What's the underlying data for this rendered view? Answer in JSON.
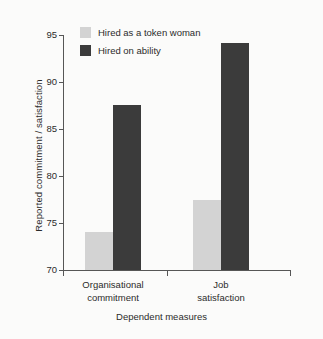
{
  "chart_data": {
    "type": "bar",
    "title": "",
    "xlabel": "Dependent measures",
    "ylabel": "Reported commitment / satisfaction",
    "categories": [
      "Organisational commitment",
      "Job satisfaction"
    ],
    "category_lines": [
      [
        "Organisational",
        "commitment"
      ],
      [
        "Job",
        "satisfaction"
      ]
    ],
    "series": [
      {
        "name": "Hired as a token woman",
        "color": "#d3d3d3",
        "values": [
          74.0,
          77.5
        ]
      },
      {
        "name": "Hired on ability",
        "color": "#3b3b3b",
        "values": [
          87.6,
          94.2
        ]
      }
    ],
    "ylim": [
      70,
      95
    ],
    "yticks": [
      70,
      75,
      80,
      85,
      90,
      95
    ],
    "ytick_labels": [
      "70",
      "75",
      "80",
      "85",
      "90",
      "95"
    ],
    "grid": false,
    "legend_position": "top-left-inside"
  },
  "legend": {
    "items": [
      {
        "label": "Hired as a token woman",
        "swatch": "light"
      },
      {
        "label": "Hired on ability",
        "swatch": "dark"
      }
    ]
  },
  "axes": {
    "y_title": "Reported commitment / satisfaction",
    "x_title": "Dependent measures"
  }
}
